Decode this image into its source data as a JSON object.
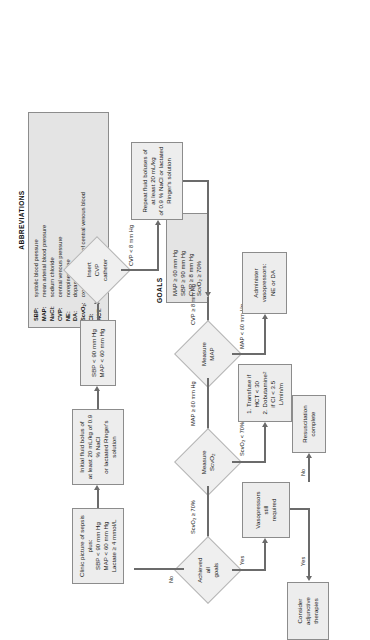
{
  "figure": {
    "orientation": "rotated-90"
  },
  "abbreviations": {
    "heading": "ABBREVIATIONS",
    "entries": [
      {
        "key": "SBP:",
        "value": "systolic blood pressure"
      },
      {
        "key": "MAP:",
        "value": "mean arterial blood pressure"
      },
      {
        "key": "NaCl:",
        "value": "sodium chloride"
      },
      {
        "key": "CVP:",
        "value": "central venous pressure"
      },
      {
        "key": "NE:",
        "value": "norepinephrine"
      },
      {
        "key": "DA:",
        "value": "dopamine"
      },
      {
        "key": "ScvO2:",
        "value": "oxygen saturation of central venous blood"
      },
      {
        "key": "CI:",
        "value": "cardiac index"
      },
      {
        "key": "HCT:",
        "value": "hematocrit"
      }
    ]
  },
  "goals": {
    "heading": "GOALS",
    "items": [
      "MAP ≥ 60 mm Hg",
      "SBP ≥ 90 mm Hg",
      "CVP ≥ 8 mm Hg",
      "ScvO2 ≥ 70%"
    ]
  },
  "nodes": {
    "start": "Clinic picture of sepsis plus:\nSBP < 90 mm Hg\nMAP < 60  mm Hg\nLactate ≥ 4 mmol/L",
    "initial_bolus": "Initial fluid bolus of\nat least 20 mL/kg of 0.9 % NaCl\nor lactated Ringer's solution",
    "check_sbp_map": "SBP < 90 mm Hg\nMAP < 60 mm Hg",
    "insert_cvp": "Insert\nCVP\ncatheter",
    "repeat_bolus": "Repeat fluid boluses of\nat least 20 mL/kg\nof 0.9 % NaCl or lactated\nRinger's solution",
    "measure_map": "Measure\nMAP",
    "administer_vasopressors": "Administer\nvasopressors:\nNE or DA",
    "measure_scvo2": "Measure\nScvO2",
    "transfuse_dobutamine": "1. Transfuse if\nHCT < 30\n2. Dobutamine\nif CI < 3.5\nL/min/m2",
    "achieved_goals": "Achieved\nall\ngoals",
    "vasopressors_required": "Vasopressors\nstill\nrequired",
    "consider_adjunctive": "Consider\nadjunctive\ntherapies",
    "resuscitation_complete": "Resuscitation\ncomplete"
  },
  "edges": {
    "cvp_lt_8": "CVP < 8 mm Hg",
    "cvp_ge_8": "CVP ≥ 8 mm Hg",
    "map_ge_60": "MAP ≥ 60  mm Hg",
    "map_lt_60": "MAP < 60  mm Hg",
    "scvo2_ge_70": "ScvO2 ≥ 70%",
    "scvo2_lt_70": "ScvO2 < 70%",
    "no": "No",
    "yes": "Yes",
    "yes2": "Yes",
    "no2": "No"
  }
}
